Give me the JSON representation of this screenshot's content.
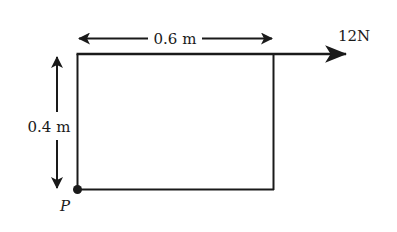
{
  "diagram": {
    "width_label": "0.6 m",
    "height_label": "0.4 m",
    "force_label": "12N",
    "point_label": "P",
    "colors": {
      "stroke": "#1a1a1a",
      "background": "#ffffff"
    },
    "rectangle": {
      "left": 77,
      "top": 54,
      "right": 274,
      "bottom": 190
    }
  }
}
